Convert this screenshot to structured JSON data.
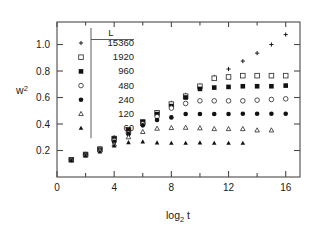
{
  "figure": {
    "background": "#ffffff",
    "frame_color": "#4a4a4a"
  },
  "chart_data": {
    "type": "scatter",
    "title": "",
    "subtitle": "",
    "xlabel": "log₂ t",
    "ylabel": "w²",
    "xlim": [
      0,
      17
    ],
    "ylim": [
      0.0,
      1.17
    ],
    "xticks": [
      0,
      4,
      8,
      12,
      16
    ],
    "xtick_labels": [
      "0",
      "4",
      "8",
      "12",
      "16"
    ],
    "xminor_ticks": [
      2,
      6,
      10,
      14
    ],
    "yticks": [
      0.2,
      0.4,
      0.6,
      0.8,
      1.0
    ],
    "ytick_labels": [
      "0.2",
      "0.4",
      "0.6",
      "0.8",
      "1.0"
    ],
    "grid": false,
    "legend_position": "upper-left-inside",
    "legend_title": "L",
    "x": [
      1,
      2,
      3,
      4,
      5,
      6,
      7,
      8,
      9,
      10,
      11,
      12,
      13,
      14,
      15,
      16
    ],
    "series": [
      {
        "name": "15360",
        "marker": "plus",
        "filled": false,
        "x": [
          1,
          2,
          3,
          4,
          5,
          6,
          7,
          8,
          9,
          10,
          11,
          12,
          13,
          14,
          15,
          16
        ],
        "values": [
          0.13,
          0.17,
          0.21,
          0.3,
          0.36,
          0.42,
          0.49,
          0.56,
          0.62,
          0.69,
          0.755,
          0.815,
          0.875,
          0.935,
          1.0,
          1.075
        ]
      },
      {
        "name": "1920",
        "marker": "square",
        "filled": false,
        "x": [
          1,
          2,
          3,
          4,
          5,
          6,
          7,
          8,
          9,
          10,
          11,
          12,
          13,
          14,
          15,
          16
        ],
        "values": [
          0.13,
          0.17,
          0.21,
          0.29,
          0.355,
          0.415,
          0.485,
          0.55,
          0.61,
          0.685,
          0.745,
          0.755,
          0.765,
          0.765,
          0.765,
          0.765
        ]
      },
      {
        "name": "960",
        "marker": "square",
        "filled": true,
        "x": [
          1,
          2,
          3,
          4,
          5,
          6,
          7,
          8,
          9,
          10,
          11,
          12,
          13,
          14,
          15,
          16
        ],
        "values": [
          0.13,
          0.17,
          0.21,
          0.29,
          0.355,
          0.415,
          0.475,
          0.535,
          0.6,
          0.665,
          0.675,
          0.68,
          0.685,
          0.685,
          0.685,
          0.69
        ]
      },
      {
        "name": "480",
        "marker": "circle",
        "filled": false,
        "x": [
          1,
          2,
          3,
          4,
          5,
          6,
          7,
          8,
          9,
          10,
          11,
          12,
          13,
          14,
          15,
          16
        ],
        "values": [
          0.13,
          0.17,
          0.21,
          0.275,
          0.33,
          0.4,
          0.455,
          0.52,
          0.555,
          0.575,
          0.575,
          0.575,
          0.575,
          0.58,
          0.585,
          0.59
        ]
      },
      {
        "name": "240",
        "marker": "circle",
        "filled": true,
        "x": [
          1,
          2,
          3,
          4,
          5,
          6,
          7,
          8,
          9,
          10,
          11,
          12,
          13,
          14,
          15,
          16
        ],
        "values": [
          0.13,
          0.17,
          0.205,
          0.265,
          0.325,
          0.39,
          0.43,
          0.45,
          0.475,
          0.475,
          0.475,
          0.475,
          0.478,
          0.478,
          0.478,
          0.478
        ]
      },
      {
        "name": "120",
        "marker": "triangle",
        "filled": false,
        "x": [
          1,
          2,
          3,
          4,
          5,
          6,
          7,
          8,
          9,
          10,
          11,
          12,
          13,
          14,
          15
        ],
        "values": [
          0.13,
          0.165,
          0.2,
          0.245,
          0.3,
          0.34,
          0.365,
          0.37,
          0.372,
          0.368,
          0.362,
          0.362,
          0.362,
          0.352,
          0.352
        ]
      },
      {
        "name": "60",
        "marker": "triangle",
        "filled": true,
        "x": [
          1,
          2,
          3,
          4,
          5,
          6,
          7,
          8,
          9,
          10,
          11,
          12,
          13
        ],
        "values": [
          0.125,
          0.16,
          0.19,
          0.235,
          0.26,
          0.265,
          0.258,
          0.255,
          0.255,
          0.258,
          0.255,
          0.255,
          0.255
        ]
      }
    ],
    "legend_entries": [
      {
        "label": "15360",
        "marker": "plus",
        "filled": false
      },
      {
        "label": "1920",
        "marker": "square",
        "filled": false
      },
      {
        "label": "960",
        "marker": "square",
        "filled": true
      },
      {
        "label": "480",
        "marker": "circle",
        "filled": false
      },
      {
        "label": "240",
        "marker": "circle",
        "filled": true
      },
      {
        "label": "120",
        "marker": "triangle",
        "filled": false
      },
      {
        "label": "60",
        "marker": "triangle",
        "filled": true
      }
    ]
  }
}
